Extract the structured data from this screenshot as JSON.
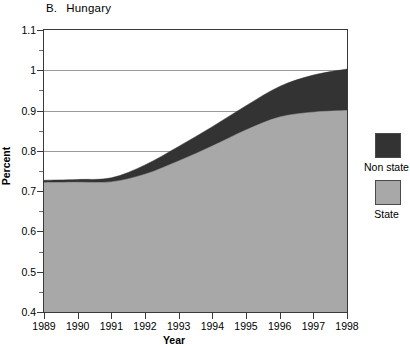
{
  "title": {
    "panel_label": "B.",
    "name": "Hungary"
  },
  "axes": {
    "ylabel": "Percent",
    "xlabel": "Year",
    "yticks": [
      "0.4",
      "0.5",
      "0.6",
      "0.7",
      "0.8",
      "0.9",
      "1",
      "1.1"
    ],
    "xticks": [
      "1989",
      "1990",
      "1991",
      "1992",
      "1993",
      "1994",
      "1995",
      "1996",
      "1997",
      "1998"
    ]
  },
  "legend": {
    "entries": [
      {
        "label": "Non state",
        "color": "#333333"
      },
      {
        "label": "State",
        "color": "#a8a8a8"
      }
    ]
  },
  "chart_data": {
    "type": "area",
    "stacked": true,
    "xlabel": "Year",
    "ylabel": "Percent",
    "grid": true,
    "legend_position": "right",
    "x": [
      1989,
      1990,
      1991,
      1992,
      1993,
      1994,
      1995,
      1996,
      1997,
      1998
    ],
    "xlim": [
      1989,
      1998
    ],
    "ylim": [
      0.4,
      1.1
    ],
    "ytick_step": 0.1,
    "yminor_tick_step": 0.05,
    "categories": [
      "1989",
      "1990",
      "1991",
      "1992",
      "1993",
      "1994",
      "1995",
      "1996",
      "1997",
      "1998"
    ],
    "series": [
      {
        "name": "State",
        "color": "#a8a8a8",
        "values": [
          0.721,
          0.722,
          0.723,
          0.742,
          0.775,
          0.812,
          0.852,
          0.884,
          0.896,
          0.9
        ]
      },
      {
        "name": "Non state",
        "color": "#333333",
        "values": [
          0.006,
          0.007,
          0.01,
          0.023,
          0.036,
          0.048,
          0.06,
          0.076,
          0.092,
          0.103
        ]
      }
    ],
    "totals": [
      0.727,
      0.729,
      0.733,
      0.765,
      0.811,
      0.86,
      0.912,
      0.96,
      0.988,
      1.003
    ]
  }
}
